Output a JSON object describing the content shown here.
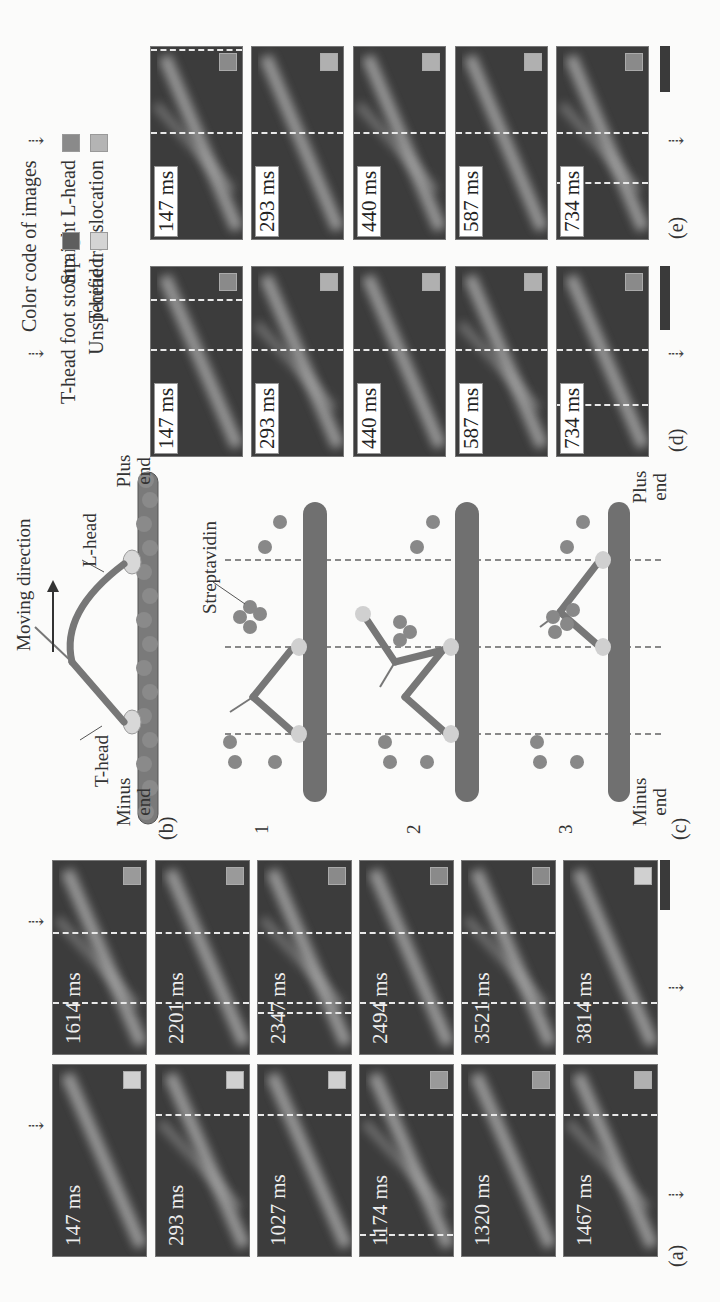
{
  "figure": {
    "panel_labels": {
      "a": "(a)",
      "b": "(b)",
      "c": "(c)",
      "d": "(d)",
      "e": "(e)"
    },
    "legend": {
      "title": "Color code of images",
      "items": [
        {
          "label": "Straight L-head",
          "color": "#8a8a8a"
        },
        {
          "label": "T-head foot stomp",
          "color": "#5e5e5e"
        },
        {
          "label": "T-head translocation",
          "color": "#b4b4b4"
        },
        {
          "label": "Unspecified",
          "color": "#d4d4d4"
        }
      ]
    },
    "panel_a": {
      "row1": [
        {
          "time": "147 ms",
          "code": "#d0d0d0"
        },
        {
          "time": "293 ms",
          "code": "#d0d0d0"
        },
        {
          "time": "1027 ms",
          "code": "#d0d0d0"
        },
        {
          "time": "1174 ms",
          "code": "#9a9a9a"
        },
        {
          "time": "1320 ms",
          "code": "#9a9a9a"
        },
        {
          "time": "1467 ms",
          "code": "#b0b0b0"
        }
      ],
      "row2": [
        {
          "time": "1614 ms",
          "code": "#9a9a9a"
        },
        {
          "time": "2201 ms",
          "code": "#9a9a9a"
        },
        {
          "time": "2347 ms",
          "code": "#8a8a8a"
        },
        {
          "time": "2494 ms",
          "code": "#8a8a8a"
        },
        {
          "time": "3521 ms",
          "code": "#8a8a8a"
        },
        {
          "time": "3814 ms",
          "code": "#d0d0d0"
        }
      ]
    },
    "panel_b": {
      "moving_direction": "Moving direction",
      "l_head": "L-head",
      "t_head": "T-head",
      "minus_end_1": "Minus",
      "minus_end_2": "end",
      "plus_end_1": "Plus",
      "plus_end_2": "end"
    },
    "panel_c": {
      "streptavidin": "Streptavidin",
      "steps": [
        "1",
        "2",
        "3"
      ],
      "minus_end_1": "Minus",
      "minus_end_2": "end",
      "plus_end_1": "Plus",
      "plus_end_2": "end"
    },
    "panel_d": {
      "frames": [
        {
          "time": "147 ms",
          "code": "#8a8a8a"
        },
        {
          "time": "293 ms",
          "code": "#b0b0b0"
        },
        {
          "time": "440 ms",
          "code": "#b0b0b0"
        },
        {
          "time": "587 ms",
          "code": "#b0b0b0"
        },
        {
          "time": "734 ms",
          "code": "#8a8a8a"
        }
      ]
    },
    "panel_e": {
      "frames": [
        {
          "time": "147 ms",
          "code": "#8a8a8a"
        },
        {
          "time": "293 ms",
          "code": "#b0b0b0"
        },
        {
          "time": "440 ms",
          "code": "#b0b0b0"
        },
        {
          "time": "587 ms",
          "code": "#b0b0b0"
        },
        {
          "time": "734 ms",
          "code": "#8a8a8a"
        }
      ]
    }
  }
}
